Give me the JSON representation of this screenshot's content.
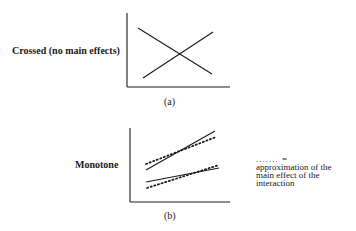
{
  "panels": [
    {
      "id": "a",
      "label": "Crossed (no main effects)",
      "caption": "(a)",
      "axes": {
        "origin": [
          127,
          87
        ],
        "y_top": 13,
        "x_right": 230
      },
      "lines": [
        {
          "style": "solid",
          "from": [
            138,
            28
          ],
          "to": [
            212,
            74
          ]
        },
        {
          "style": "solid",
          "from": [
            143,
            78
          ],
          "to": [
            213,
            32
          ]
        }
      ]
    },
    {
      "id": "b",
      "label": "Monotone",
      "caption": "(b)",
      "axes": {
        "origin": [
          130,
          202
        ],
        "y_top": 128,
        "x_right": 230
      },
      "lines": [
        {
          "style": "solid",
          "from": [
            146,
            170
          ],
          "to": [
            215,
            131
          ]
        },
        {
          "style": "dotted",
          "from": [
            146,
            164
          ],
          "to": [
            216,
            137
          ]
        },
        {
          "style": "solid",
          "from": [
            146,
            182
          ],
          "to": [
            219,
            168
          ]
        },
        {
          "style": "dotted",
          "from": [
            147,
            188
          ],
          "to": [
            219,
            165
          ]
        }
      ]
    }
  ],
  "legend": {
    "symbol": "....... =",
    "lines": [
      "approximation of the",
      "main effect of the",
      "interaction"
    ]
  },
  "colors": {
    "ink": "#1a1a1a",
    "background": "#ffffff"
  }
}
